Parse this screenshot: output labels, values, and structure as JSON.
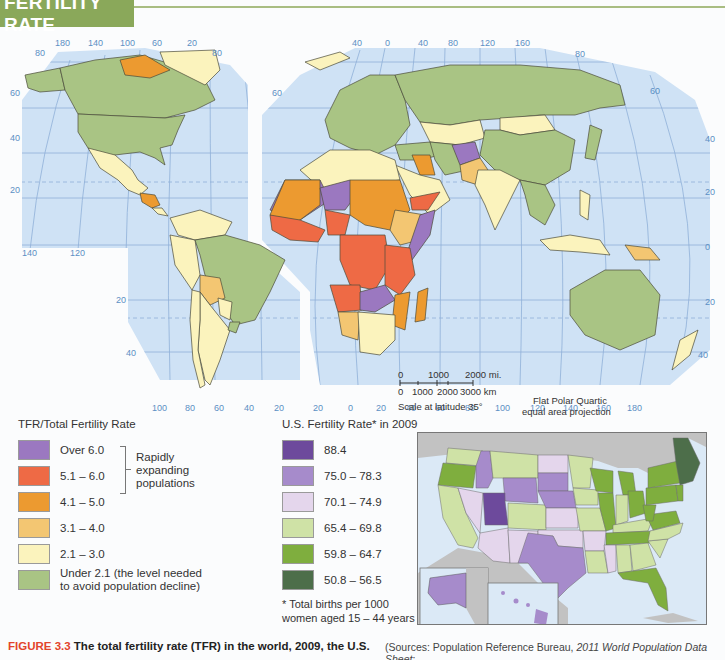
{
  "header": {
    "title": "FERTILITY RATE"
  },
  "map": {
    "projection_note": [
      "Flat Polar Quartic",
      "equal area projection"
    ],
    "scale": {
      "miles_labels": [
        "0",
        "1000",
        "2000 mi."
      ],
      "km_labels": [
        "0",
        "1000",
        "2000",
        "3000 km"
      ],
      "note": "Scale at latitude 35°"
    },
    "ticks": {
      "americas_top": [
        "180",
        "140",
        "100",
        "60",
        "20"
      ],
      "americas_bottom_left": [
        "140",
        "120"
      ],
      "americas_left_lat": [
        "80",
        "60",
        "40",
        "20"
      ],
      "south_america_lat": [
        "20",
        "40"
      ],
      "south_america_bottom": [
        "100",
        "80",
        "60",
        "40",
        "20"
      ],
      "eurasia_top": [
        "40",
        "0",
        "40",
        "80",
        "120",
        "160"
      ],
      "eurasia_left_lat": [
        "60"
      ],
      "eurasia_right_lat": [
        "80",
        "60",
        "40",
        "20",
        "0",
        "20",
        "40"
      ],
      "eurasia_bottom": [
        "20",
        "0",
        "20",
        "40",
        "60",
        "80",
        "100",
        "120",
        "140",
        "160",
        "180"
      ],
      "americas_right_lat": [
        "80"
      ]
    },
    "colors": {
      "ocean": "#cfe2f5",
      "grid": "#7fa6d4",
      "over_6": "#9b78c0",
      "r_5_1_6": "#ee6a45",
      "r_4_1_5": "#ec9a30",
      "r_3_1_4": "#f3c672",
      "r_2_1_3": "#fbf3bd",
      "under_2_1": "#a9c484"
    }
  },
  "legend_tfr": {
    "title": "TFR/Total Fertility Rate",
    "items": [
      {
        "label": "Over 6.0",
        "color": "#9b78c0"
      },
      {
        "label": "5.1 – 6.0",
        "color": "#ee6a45"
      },
      {
        "label": "4.1 – 5.0",
        "color": "#ec9a30"
      },
      {
        "label": "3.1 – 4.0",
        "color": "#f3c672"
      },
      {
        "label": "2.1 – 3.0",
        "color": "#fbf3bd"
      },
      {
        "label": "Under 2.1 (the level needed to avoid population decline)",
        "color": "#a9c484"
      }
    ],
    "bracket_note": "Rapidly expanding populations",
    "item6_line1": "Under 2.1 (the level needed",
    "item6_line2": "to avoid population decline)"
  },
  "legend_us": {
    "title": "U.S. Fertility Rate* in 2009",
    "items": [
      {
        "label": "88.4",
        "color": "#6d4a9c"
      },
      {
        "label": "75.0 – 78.3",
        "color": "#a68bcb"
      },
      {
        "label": "70.1 – 74.9",
        "color": "#e4d6ec"
      },
      {
        "label": "65.4 – 69.8",
        "color": "#cfe2a6"
      },
      {
        "label": "59.8 – 64.7",
        "color": "#7fae3e"
      },
      {
        "label": "50.8 – 56.5",
        "color": "#4d6e4a"
      }
    ],
    "footnote_line1": "* Total births per 1000",
    "footnote_line2": "women aged 15 – 44 years"
  },
  "caption": {
    "figure_label": "FIGURE 3.3",
    "text": "The total fertility rate (TFR) in the world, 2009, the U.S.",
    "sources_prefix": "(Sources: Population Reference Bureau, ",
    "sources_italic": "2011 World Population Data Sheet",
    "sources_suffix": ";"
  }
}
